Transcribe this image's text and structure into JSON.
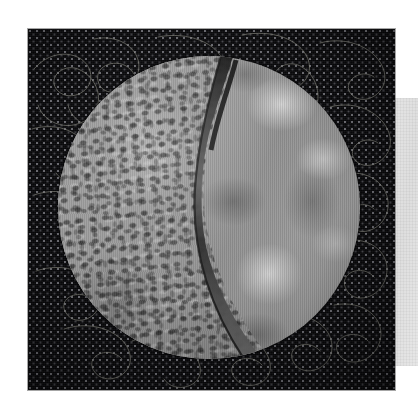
{
  "image": {
    "subject": "Quilt block photograph",
    "description": "Square dark navy dotted quilt block with meandering stipple quilting, centered circular appliqué split by a curved seam into two gray fabrics",
    "background_color": "#ffffff",
    "canvas": {
      "width": 418,
      "height": 414
    }
  },
  "quilt_block": {
    "name": "dark dotted background fabric",
    "fabric": "black-navy tonal dot print",
    "color": "#070709",
    "dot_color": "#cdcdd7",
    "quilting": {
      "style": "meandering stipple with loops",
      "thread_color": "#8c8c82"
    },
    "bounds": {
      "x": 28,
      "y": 29,
      "width": 367,
      "height": 361
    }
  },
  "circle_applique": {
    "name": "circular appliqué",
    "bounds": {
      "x": 58,
      "y": 56,
      "width": 302,
      "height": 303
    },
    "seam": {
      "name": "curved dividing seam",
      "color": "#2d2d2d",
      "orientation": "top-center to bottom-center, bowed left"
    },
    "left_fabric": {
      "name": "block print fabric",
      "pattern": "dense small rectangular blocks / brick texture",
      "base_color": "#9b9b9b",
      "mark_color": "#3a3a3a"
    },
    "right_fabric": {
      "name": "mottled marble fabric",
      "pattern": "cloudy mottled marbling",
      "base_color": "#9e9e9e",
      "highlight_color": "#e8e8e8",
      "shadow_color": "#6f6f6f"
    }
  },
  "edge_panel": {
    "name": "right edge light gray strip",
    "color": "#e2e2e2",
    "bounds": {
      "x": 394,
      "y": 98,
      "width": 24,
      "height": 268
    }
  }
}
